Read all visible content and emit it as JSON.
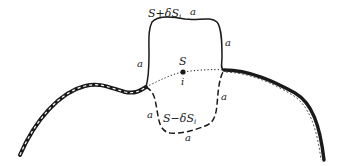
{
  "diagram": {
    "labels": {
      "upper_surface": "S+δS",
      "upper_subscript": "i",
      "lower_surface": "S−δS",
      "lower_subscript": "i",
      "point": "S",
      "point_index": "i",
      "edge_a": "a"
    },
    "colors": {
      "stroke": "#1a1a1a",
      "background": "#ffffff"
    }
  }
}
